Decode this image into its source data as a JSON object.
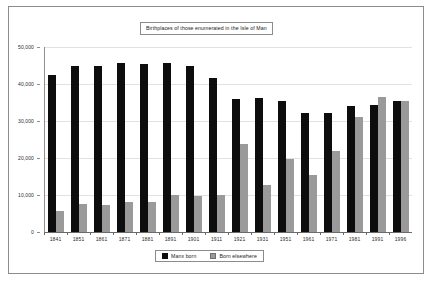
{
  "chart_data": {
    "type": "bar",
    "title": "Birthplaces of those enumerated in the Isle of Man",
    "xlabel": "",
    "ylabel": "",
    "ylim": [
      0,
      50000
    ],
    "grid": true,
    "legend_position": "bottom",
    "categories": [
      "1841",
      "1851",
      "1861",
      "1871",
      "1881",
      "1891",
      "1901",
      "1911",
      "1921",
      "1931",
      "1951",
      "1961",
      "1971",
      "1981",
      "1991",
      "1996"
    ],
    "ytick_labels": [
      "0",
      "10,000",
      "20,000",
      "30,000",
      "40,000",
      "50,000"
    ],
    "ytick_values": [
      0,
      10000,
      20000,
      30000,
      40000,
      50000
    ],
    "series": [
      {
        "name": "Manx born",
        "color": "#0d0d0d",
        "values": [
          42400,
          44800,
          45000,
          45700,
          45400,
          45600,
          44800,
          41700,
          36000,
          36200,
          35300,
          32100,
          32100,
          34000,
          34200,
          35400
        ]
      },
      {
        "name": "Born elsewhere",
        "color": "#9a9a9a",
        "values": [
          5800,
          7500,
          7400,
          8000,
          8000,
          9900,
          9800,
          10000,
          23700,
          12600,
          19700,
          15400,
          21800,
          31200,
          36400,
          35500
        ]
      }
    ]
  },
  "legend": {
    "entries": [
      {
        "label": "Manx born"
      },
      {
        "label": "Born elsewhere"
      }
    ]
  }
}
